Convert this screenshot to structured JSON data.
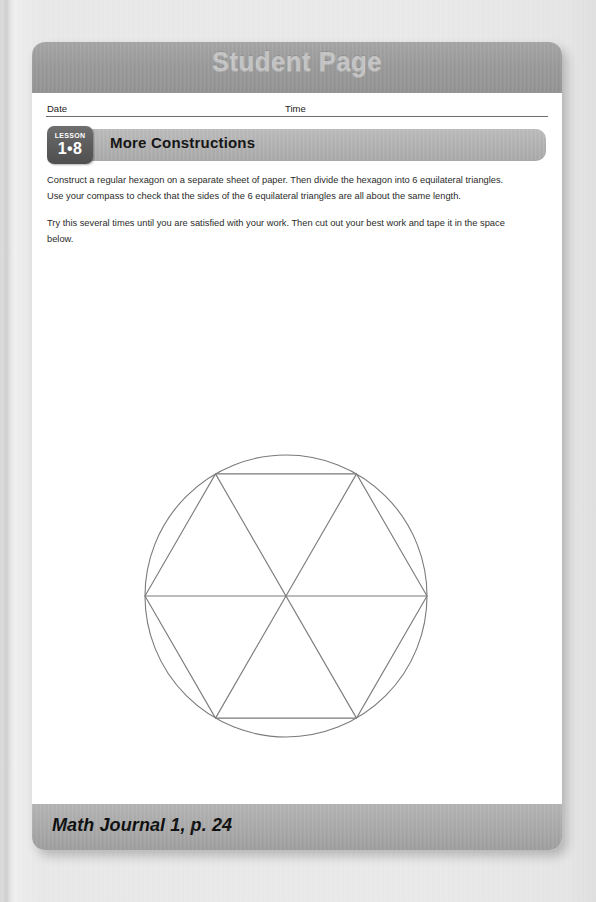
{
  "header": {
    "title": "Student Page",
    "bar_color": "#9b9b9b",
    "title_color": "#c6c6c6"
  },
  "fields": {
    "date_label": "Date",
    "time_label": "Time",
    "date_value": "",
    "time_value": ""
  },
  "lesson": {
    "badge_word": "LESSON",
    "badge_number": "1•8",
    "title": "More Constructions",
    "badge_color": "#5d5d5d",
    "titlebar_color": "#b2b2b2"
  },
  "body": {
    "paragraphs": [
      "Construct a regular hexagon on a separate sheet of paper. Then divide the hexagon into 6 equilateral triangles. Use your compass to check that the sides of the 6 equilateral triangles are all about the same length.",
      "Try this several times until you are satisfied with your work. Then cut out your best work and tape it in the space below."
    ]
  },
  "figure": {
    "name": "hexagon-in-circle-diagram",
    "shape": "regular hexagon inscribed in a circle, divided into 6 equilateral triangles",
    "stroke_color": "#7a7a7a",
    "circle": {
      "cx": 150,
      "cy": 150,
      "r": 141
    },
    "hexagon_vertices": [
      {
        "x": 9,
        "y": 150
      },
      {
        "x": 79.5,
        "y": 27.9
      },
      {
        "x": 220.5,
        "y": 27.9
      },
      {
        "x": 291,
        "y": 150
      },
      {
        "x": 220.5,
        "y": 272.1
      },
      {
        "x": 79.5,
        "y": 272.1
      }
    ],
    "diagonals": 3,
    "triangles": 6
  },
  "footer": {
    "text": "Math Journal 1, p. 24",
    "bar_color": "#a9a9a9"
  }
}
